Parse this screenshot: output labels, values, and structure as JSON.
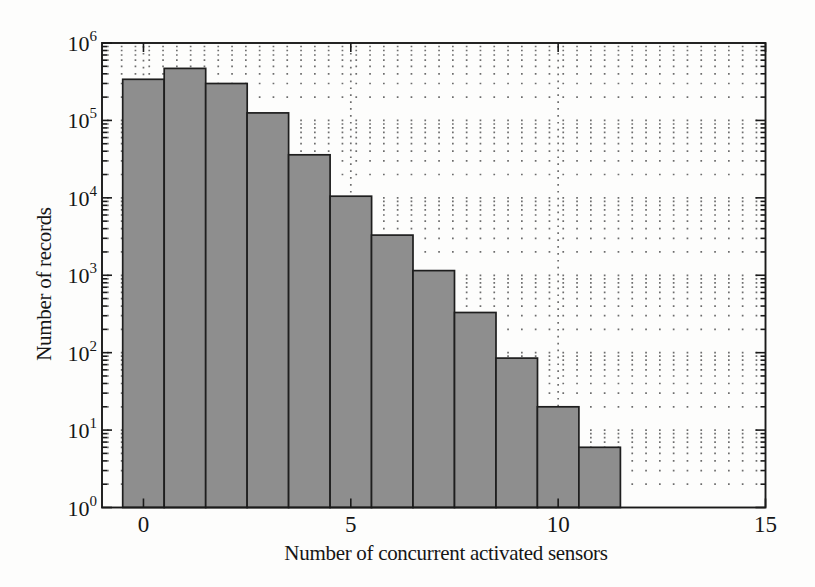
{
  "chart_data": {
    "type": "bar",
    "title": "",
    "xlabel": "Number of concurrent activated sensors",
    "ylabel": "Number of records",
    "categories": [
      0,
      1,
      2,
      3,
      4,
      5,
      6,
      7,
      8,
      9,
      10,
      11
    ],
    "values": [
      340000,
      470000,
      300000,
      125000,
      36000,
      10500,
      3300,
      1150,
      330,
      85,
      20,
      6
    ],
    "bar_width": 1,
    "xlim": [
      -1,
      15
    ],
    "yscale": "log",
    "y_exp_range": [
      0,
      6
    ],
    "x_ticks": [
      0,
      5,
      10,
      15
    ],
    "y_tick_exponents": [
      0,
      1,
      2,
      3,
      4,
      5,
      6
    ],
    "y_tick_base": "10",
    "grid": "dotted, horizontal lines at log minor+major ticks, vertical lines at x major ticks",
    "legend": "none",
    "colors": {
      "bar_fill": "#8e8e8e",
      "bar_edge": "#1e1e1e",
      "axis": "#1a1a1a",
      "grid_dot": "#6d6d6d",
      "text": "#161616",
      "background": "#fdfdfc"
    }
  }
}
